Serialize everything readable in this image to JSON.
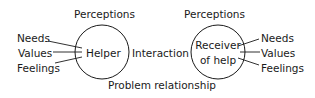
{
  "diagram": {
    "helper": {
      "label": "Helper",
      "perceptions": "Perceptions",
      "attributes": [
        "Needs",
        "Values",
        "Feelings"
      ]
    },
    "receiver": {
      "label_line1": "Receiver",
      "label_line2": "of help",
      "perceptions": "Perceptions",
      "attributes": [
        "Needs",
        "Values",
        "Feelings"
      ]
    },
    "interaction_label": "Interaction",
    "relationship_label": "Problem relationship",
    "colors": {
      "stroke": "#1a1a1a",
      "background": "#ffffff"
    }
  }
}
